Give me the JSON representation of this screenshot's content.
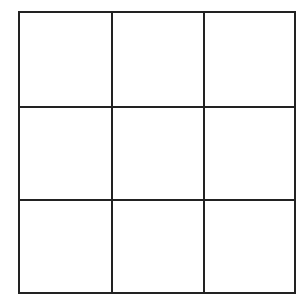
{
  "board": {
    "rows": 3,
    "cols": 3,
    "line_color": "#222222",
    "background": "#ffffff",
    "cells": [
      {
        "id": "0-0",
        "mark": ""
      },
      {
        "id": "0-1",
        "mark": ""
      },
      {
        "id": "0-2",
        "mark": ""
      },
      {
        "id": "1-0",
        "mark": ""
      },
      {
        "id": "1-1",
        "mark": ""
      },
      {
        "id": "1-2",
        "mark": ""
      },
      {
        "id": "2-0",
        "mark": ""
      },
      {
        "id": "2-1",
        "mark": ""
      },
      {
        "id": "2-2",
        "mark": ""
      }
    ]
  }
}
